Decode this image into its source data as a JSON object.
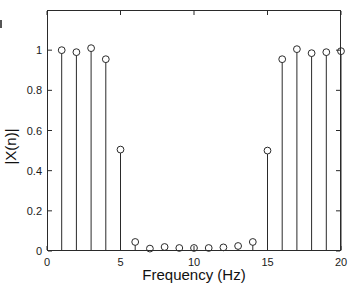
{
  "figure": {
    "background": "#ffffff",
    "axis_color": "#2a2a2a",
    "stem_color": "#2a2a2a",
    "marker_fill": "#ffffff",
    "label_color": "#111111"
  },
  "chart_data": {
    "type": "stem",
    "title": "",
    "xlabel": "Frequency (Hz)",
    "ylabel": "|X(n)|",
    "xlim": [
      0,
      20
    ],
    "ylim": [
      0,
      1.2
    ],
    "xticks": [
      0,
      5,
      10,
      15,
      20
    ],
    "yticks": [
      0,
      0.2,
      0.4,
      0.6,
      0.8,
      1
    ],
    "grid": false,
    "box": true,
    "marker": "open-circle",
    "legend": null,
    "x": [
      1,
      2,
      3,
      4,
      5,
      6,
      7,
      8,
      9,
      10,
      11,
      12,
      13,
      14,
      15,
      16,
      17,
      18,
      19,
      20
    ],
    "y": [
      1.0,
      0.99,
      1.01,
      0.955,
      0.505,
      0.045,
      0.012,
      0.02,
      0.015,
      0.015,
      0.015,
      0.018,
      0.025,
      0.045,
      0.5,
      0.955,
      1.005,
      0.985,
      0.99,
      0.995
    ]
  }
}
